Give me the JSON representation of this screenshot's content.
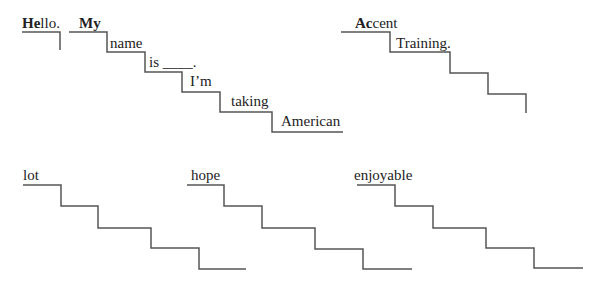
{
  "line_color": "#555555",
  "phrases": [
    {
      "name": "hello",
      "words": [
        {
          "bold": "He",
          "rest": "llo.",
          "x": 22,
          "y": 16
        }
      ],
      "points": "22,32 60,32 60,50"
    },
    {
      "name": "my-name-is",
      "words": [
        {
          "bold": "My",
          "rest": "",
          "x": 79,
          "y": 16
        },
        {
          "bold": "",
          "rest": "name",
          "x": 110,
          "y": 36
        },
        {
          "bold": "",
          "rest": "is ____.",
          "x": 149,
          "y": 55
        },
        {
          "bold": "",
          "rest": "I’m",
          "x": 190,
          "y": 74
        },
        {
          "bold": "",
          "rest": "taking",
          "x": 231,
          "y": 94
        },
        {
          "bold": "",
          "rest": "American",
          "x": 281,
          "y": 114
        }
      ],
      "points": "69,32 107,32 107,52 145,52 145,72 182,72 182,92 220,92 220,112 272,112 272,132 343,132"
    },
    {
      "name": "accent-training",
      "words": [
        {
          "bold": "Ac",
          "rest": "cent",
          "x": 355,
          "y": 16
        },
        {
          "bold": "",
          "rest": "Training.",
          "x": 396,
          "y": 36
        }
      ],
      "points": "341,32 390,32 390,52 450,52 450,73 488,73 488,94 526,94 526,113"
    },
    {
      "name": "lot",
      "words": [
        {
          "bold": "",
          "rest": "lot",
          "x": 23,
          "y": 168
        }
      ],
      "points": "23,185 61,185 61,206 98,206 98,228 151,228 151,248 199,248 199,269 246,269"
    },
    {
      "name": "hope",
      "words": [
        {
          "bold": "",
          "rest": "hope",
          "x": 191,
          "y": 168
        }
      ],
      "points": "187,185 224,185 224,206 262,206 262,228 315,228 315,249 363,249 363,269 412,269"
    },
    {
      "name": "enjoyable",
      "words": [
        {
          "bold": "",
          "rest": "enjoyable",
          "x": 354,
          "y": 168
        }
      ],
      "points": "357,185 395,185 395,206 433,206 433,228 486,228 486,248 534,248 534,268 583,268"
    }
  ]
}
